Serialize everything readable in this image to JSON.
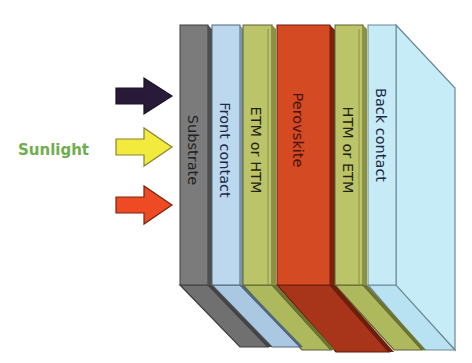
{
  "diagram": {
    "sunlight": {
      "label": "Sunlight",
      "label_color": "#6fae4e",
      "arrows": [
        {
          "name": "arrow-dark",
          "color": "#2a1a3a"
        },
        {
          "name": "arrow-yellow",
          "color": "#f2ea3c"
        },
        {
          "name": "arrow-red",
          "color": "#ee4a23"
        }
      ]
    },
    "layers": [
      {
        "label": "Substrate",
        "color": "#7b7b7b",
        "side_color": "#5c5c5c",
        "bottom_color": "#6e6e6e"
      },
      {
        "label": "Front contact",
        "color": "#bcd8ef",
        "side_color": "#9fbcd4",
        "bottom_color": "#aac8e2"
      },
      {
        "label": "ETM or HTM",
        "color": "#bcc46a",
        "side_color": "#9da650",
        "bottom_color": "#aeb75c"
      },
      {
        "label": "Perovskite",
        "color": "#d44a22",
        "side_color": "#8f2a12",
        "bottom_color": "#a8341a"
      },
      {
        "label": "HTM or ETM",
        "color": "#bcc46a",
        "side_color": "#9da650",
        "bottom_color": "#aeb75c"
      },
      {
        "label": "Back contact",
        "color": "#c6eaf6",
        "side_color": "#bde6f4",
        "bottom_color": "#b5e0f0"
      }
    ]
  }
}
